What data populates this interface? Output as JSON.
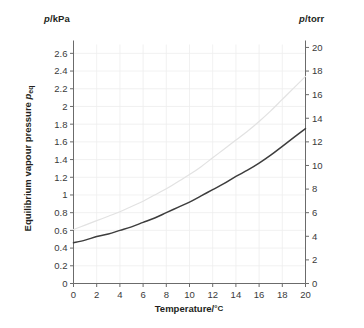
{
  "chart_data": {
    "type": "line",
    "title": "",
    "xlabel": "Temperature/°C",
    "ylabel": "Equilibrium vapour pressure p_eq",
    "left_axis_label": "p /kPa",
    "right_axis_label": "p /torr",
    "xlim": [
      0,
      20
    ],
    "ylim": [
      0,
      2.7
    ],
    "right_ylim": [
      0,
      20.25
    ],
    "grid": true,
    "legend": "none",
    "xticks": [
      0,
      2,
      4,
      6,
      8,
      10,
      12,
      14,
      16,
      18,
      20
    ],
    "xticklabels": [
      "0",
      "2",
      "4",
      "6",
      "8",
      "10",
      "12",
      "14",
      "16",
      "18",
      "20"
    ],
    "yticks": [
      0,
      0.2,
      0.4,
      0.6,
      0.8,
      1.0,
      1.2,
      1.4,
      1.6,
      1.8,
      2.0,
      2.2,
      2.4,
      2.6
    ],
    "yticklabels": [
      "0",
      "0.2",
      "0.4",
      "0.6",
      "0.8",
      "1",
      "1.2",
      "1.4",
      "1.6",
      "1.8",
      "2",
      "2.2",
      "2.4",
      "2.6"
    ],
    "right_yticks": [
      0,
      2,
      4,
      6,
      8,
      10,
      12,
      14,
      16,
      18,
      20
    ],
    "right_yticklabels": [
      "0",
      "2",
      "4",
      "6",
      "8",
      "10",
      "12",
      "14",
      "16",
      "18",
      "20"
    ],
    "x": [
      0,
      1,
      2,
      3,
      4,
      5,
      6,
      7,
      8,
      9,
      10,
      11,
      12,
      13,
      14,
      15,
      16,
      17,
      18,
      19,
      20
    ],
    "series": [
      {
        "name": "lower-curve",
        "color": "#3d3d3d",
        "width": 1.5,
        "values": [
          0.46,
          0.49,
          0.53,
          0.56,
          0.6,
          0.64,
          0.69,
          0.74,
          0.8,
          0.86,
          0.92,
          0.99,
          1.06,
          1.13,
          1.21,
          1.28,
          1.36,
          1.45,
          1.55,
          1.65,
          1.75
        ]
      },
      {
        "name": "upper-curve",
        "color": "#e2e2e2",
        "width": 1.2,
        "values": [
          0.61,
          0.66,
          0.71,
          0.76,
          0.81,
          0.87,
          0.93,
          1.0,
          1.07,
          1.15,
          1.23,
          1.32,
          1.42,
          1.52,
          1.62,
          1.72,
          1.83,
          1.95,
          2.08,
          2.21,
          2.34
        ]
      }
    ]
  },
  "axes": {
    "left_unit_symbol": "p",
    "left_unit_rest": "/kPa",
    "right_unit_symbol": "p",
    "right_unit_rest": "/torr",
    "ytitle_text": "Equilibrium vapour pressure ",
    "ytitle_symbol": "p",
    "ytitle_sub": "eq",
    "xtitle_text": "Temperature/",
    "xtitle_unit": "°C"
  }
}
